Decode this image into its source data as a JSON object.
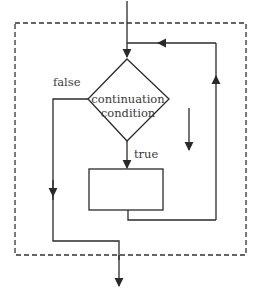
{
  "diagram": {
    "type": "flowchart",
    "decision": {
      "label_line1": "continuation",
      "label_line2": "condition"
    },
    "branches": {
      "true_label": "true",
      "false_label": "false"
    },
    "body_box_label": "",
    "colors": {
      "stroke": "#2a2a2a",
      "dashed_border": "#333333",
      "text": "#3a3a3a",
      "background": "#ffffff"
    }
  }
}
